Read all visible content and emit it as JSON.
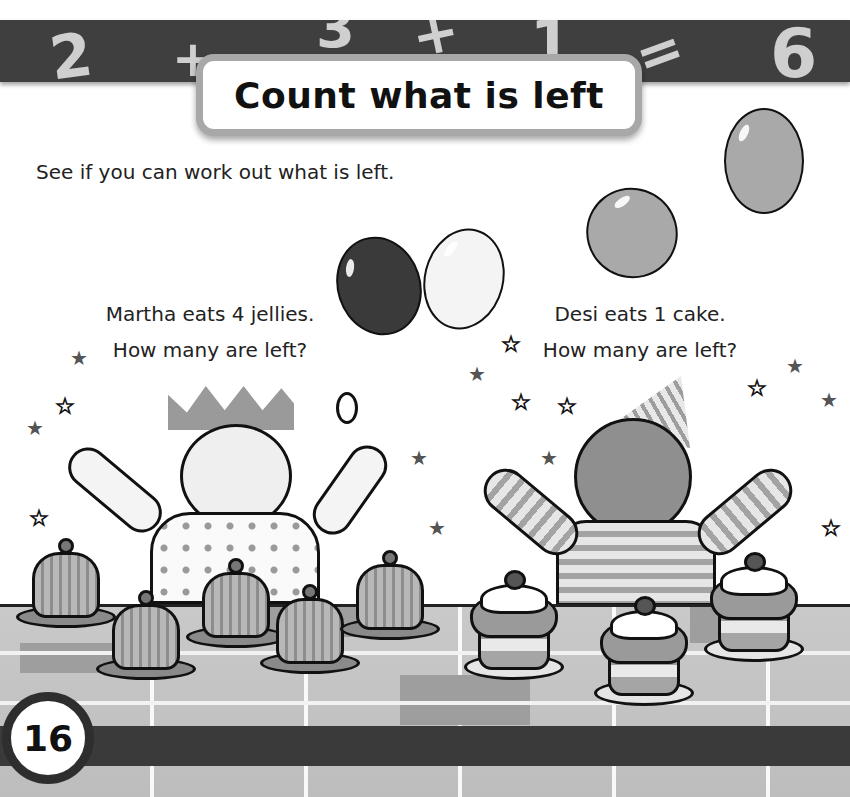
{
  "header": {
    "band_equation": [
      "2",
      "+",
      "3",
      "+",
      "1",
      "=",
      "6"
    ],
    "title": "Count what is left"
  },
  "intro": "See if you can work out what is left.",
  "left_problem": {
    "line1": "Martha eats 4 jellies.",
    "line2": "How many are left?",
    "character": "Martha",
    "item": "jellies",
    "items_shown": 5,
    "items_eaten": 4
  },
  "right_problem": {
    "line1": "Desi eats 1 cake.",
    "line2": "How many are left?",
    "character": "Desi",
    "item": "cake",
    "items_shown": 3,
    "items_eaten": 1
  },
  "balloons": [
    {
      "shade": "#3a3a3a"
    },
    {
      "shade": "#f4f4f4"
    },
    {
      "shade": "#a9a9a9"
    },
    {
      "shade": "#a9a9a9"
    }
  ],
  "footer": {
    "page_number": "16"
  },
  "colors": {
    "band": "#3f3f3f",
    "band_glyph": "#cfcfcf",
    "title_border": "#a8a8a8",
    "table": "#c4c4c4"
  }
}
